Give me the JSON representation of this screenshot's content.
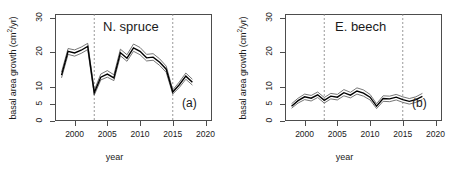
{
  "figure": {
    "background": "#ffffff",
    "line_color": "#000000",
    "band_color": "#666666",
    "refline_color": "#808080",
    "axis_color": "#4d4d4d"
  },
  "axis": {
    "xlabel": "year",
    "ylabel_text": "basal area growth (cm",
    "ylabel_sup": "2",
    "ylabel_tail": "/yr)",
    "xticks": [
      "2000",
      "2005",
      "2010",
      "2015",
      "2020"
    ],
    "xtick_values": [
      2000,
      2005,
      2010,
      2015,
      2020
    ],
    "yticks": [
      "0",
      "5",
      "10",
      "20",
      "30"
    ],
    "ytick_values": [
      0,
      5,
      10,
      20,
      30
    ],
    "xlim": [
      1997,
      2021
    ],
    "ylim": [
      0,
      31
    ]
  },
  "panels": {
    "a": {
      "title": "N. spruce",
      "tag": "(a)"
    },
    "b": {
      "title": "E. beech",
      "tag": "(b)"
    }
  },
  "chart_data": [
    {
      "type": "line",
      "title": "N. spruce",
      "panel_tag": "(a)",
      "xlabel": "year",
      "ylabel": "basal area growth (cm2/yr)",
      "xlim": [
        1997,
        2021
      ],
      "ylim": [
        0,
        31
      ],
      "xticks": [
        2000,
        2005,
        2010,
        2015,
        2020
      ],
      "yticks": [
        0,
        5,
        10,
        20,
        30
      ],
      "grid": false,
      "legend": "none",
      "reference_lines": {
        "type": "vertical-dashed",
        "x": [
          2003,
          2015
        ],
        "color": "#808080"
      },
      "x": [
        1998,
        1999,
        2000,
        2001,
        2002,
        2003,
        2004,
        2005,
        2006,
        2007,
        2008,
        2009,
        2010,
        2011,
        2012,
        2013,
        2014,
        2015,
        2016,
        2017,
        2018
      ],
      "series": [
        {
          "name": "mean",
          "values": [
            13.3,
            20.2,
            19.7,
            20.5,
            21.6,
            8.2,
            12.7,
            13.6,
            12.5,
            19.8,
            18.2,
            21.2,
            20.2,
            18.3,
            18.5,
            17.0,
            15.0,
            8.4,
            10.5,
            13.0,
            11.2
          ]
        },
        {
          "name": "upper-ci",
          "values": [
            14.2,
            21.0,
            20.6,
            21.4,
            22.5,
            8.9,
            13.6,
            14.6,
            13.4,
            20.8,
            19.2,
            22.3,
            21.3,
            19.3,
            19.5,
            18.0,
            15.9,
            9.0,
            11.3,
            13.9,
            12.1
          ]
        },
        {
          "name": "lower-ci",
          "values": [
            12.5,
            19.3,
            18.8,
            19.6,
            20.7,
            7.5,
            11.9,
            12.7,
            11.7,
            18.9,
            17.3,
            20.2,
            19.2,
            17.4,
            17.6,
            16.1,
            14.1,
            7.8,
            9.7,
            12.1,
            10.4
          ]
        }
      ]
    },
    {
      "type": "line",
      "title": "E. beech",
      "panel_tag": "(b)",
      "xlabel": "year",
      "ylabel": "basal area growth (cm2/yr)",
      "xlim": [
        1997,
        2021
      ],
      "ylim": [
        0,
        31
      ],
      "xticks": [
        2000,
        2005,
        2010,
        2015,
        2020
      ],
      "yticks": [
        0,
        5,
        10,
        20,
        30
      ],
      "grid": false,
      "legend": "none",
      "reference_lines": {
        "type": "vertical-dashed",
        "x": [
          2003,
          2015
        ],
        "color": "#808080"
      },
      "x": [
        1998,
        1999,
        2000,
        2001,
        2002,
        2003,
        2004,
        2005,
        2006,
        2007,
        2008,
        2009,
        2010,
        2011,
        2012,
        2013,
        2014,
        2015,
        2016,
        2017,
        2018
      ],
      "series": [
        {
          "name": "mean",
          "values": [
            4.3,
            5.9,
            7.0,
            6.6,
            7.6,
            6.0,
            7.2,
            6.9,
            8.2,
            7.5,
            8.7,
            8.1,
            6.9,
            4.3,
            6.5,
            6.4,
            6.9,
            6.2,
            5.7,
            6.2,
            7.1
          ]
        },
        {
          "name": "upper-ci",
          "values": [
            5.0,
            6.6,
            7.8,
            7.4,
            8.4,
            6.8,
            8.0,
            7.7,
            9.1,
            8.3,
            9.6,
            9.0,
            7.7,
            5.0,
            7.3,
            7.2,
            7.7,
            7.0,
            6.5,
            7.0,
            8.0
          ]
        },
        {
          "name": "lower-ci",
          "values": [
            3.7,
            5.2,
            6.2,
            5.8,
            6.8,
            5.2,
            6.4,
            6.1,
            7.3,
            6.7,
            7.8,
            7.2,
            6.1,
            3.6,
            5.7,
            5.6,
            6.1,
            5.4,
            4.9,
            5.4,
            6.2
          ]
        }
      ]
    }
  ]
}
